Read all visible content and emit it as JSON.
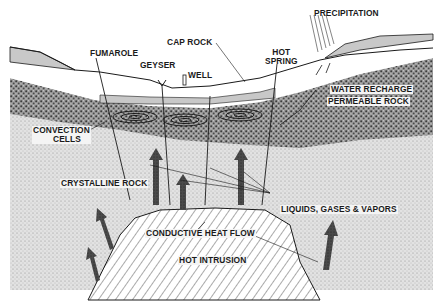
{
  "diagram": {
    "colors": {
      "ink": "#1a1a1a",
      "cap_rock": "#c8c8c8",
      "permeable_rock": "#6e6e6e",
      "crystalline_rock": "#d6d6d6",
      "surface": "#ffffff",
      "intrusion": "#ffffff",
      "arrow": "#4a4a4a"
    },
    "labels": {
      "precipitation": "PRECIPITATION",
      "cap_rock": "CAP ROCK",
      "fumarole": "FUMAROLE",
      "hot_spring_1": "HOT",
      "hot_spring_2": "SPRING",
      "geyser": "GEYSER",
      "well": "WELL",
      "water_recharge": "WATER RECHARGE",
      "permeable_rock": "PERMEABLE ROCK",
      "convection_cells_1": "CONVECTION",
      "convection_cells_2": "CELLS",
      "crystalline_rock": "CRYSTALLINE  ROCK",
      "liquids_gases_vapors": "LIQUIDS, GASES & VAPORS",
      "conductive_heat_flow": "CONDUCTIVE  HEAT FLOW",
      "hot_intrusion": "HOT  INTRUSION"
    }
  }
}
